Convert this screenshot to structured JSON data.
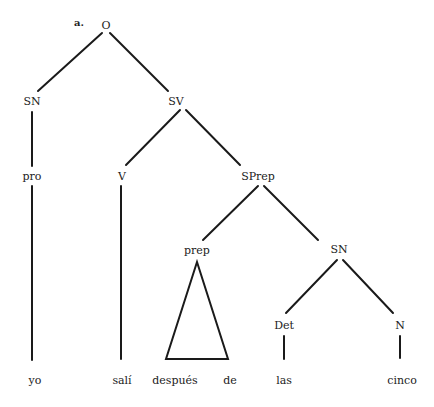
{
  "diagram": {
    "label": "a.",
    "nodes": {
      "O": "O",
      "SN1": "SN",
      "SV": "SV",
      "pro": "pro",
      "V": "V",
      "SPrep": "SPrep",
      "prep": "prep",
      "SN2": "SN",
      "Det": "Det",
      "N": "N"
    },
    "leaves": {
      "yo": "yo",
      "sali": "salí",
      "despues": "después",
      "de": "de",
      "las": "las",
      "cinco": "cinco"
    },
    "edges": [
      [
        "O",
        "SN1"
      ],
      [
        "O",
        "SV"
      ],
      [
        "SN1",
        "pro"
      ],
      [
        "pro",
        "yo"
      ],
      [
        "SV",
        "V"
      ],
      [
        "SV",
        "SPrep"
      ],
      [
        "V",
        "sali"
      ],
      [
        "SPrep",
        "prep"
      ],
      [
        "SPrep",
        "SN2"
      ],
      [
        "prep",
        "triangle: después de"
      ],
      [
        "SN2",
        "Det"
      ],
      [
        "SN2",
        "N"
      ],
      [
        "Det",
        "las"
      ],
      [
        "N",
        "cinco"
      ]
    ]
  }
}
